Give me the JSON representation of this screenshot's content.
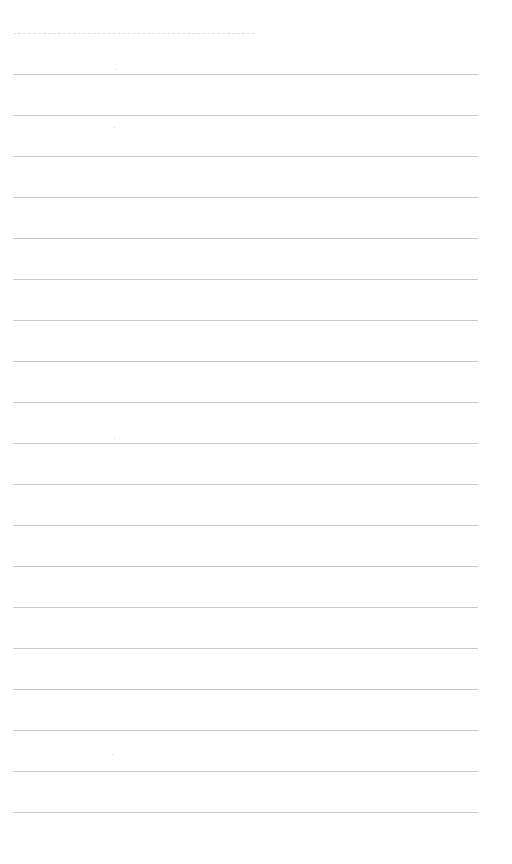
{
  "page": {
    "type": "lined-paper",
    "header_text": "",
    "footer_text": "",
    "header_dashed_rule": {
      "x": 13,
      "y": 33,
      "width": 242
    },
    "rules": {
      "count": 19,
      "start_y": 74,
      "spacing": 41,
      "x": 13,
      "width": 465,
      "color": "#c9c9c9"
    }
  }
}
